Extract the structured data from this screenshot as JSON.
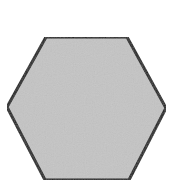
{
  "diagram": {
    "shape": "hexagon",
    "orientation": "flat-top",
    "fill_color": "#c4c4c4",
    "stroke_color": "#1a1a1a",
    "stroke_width": 3,
    "background_color": "#ffffff",
    "vertices": [
      [
        46,
        37
      ],
      [
        127,
        37
      ],
      [
        166,
        108
      ],
      [
        129,
        180
      ],
      [
        45,
        180
      ],
      [
        7,
        107
      ]
    ]
  }
}
